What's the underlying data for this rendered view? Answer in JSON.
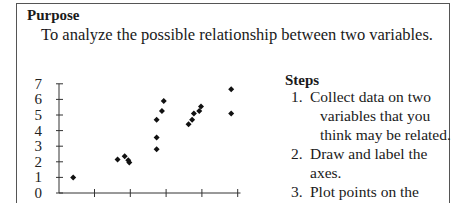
{
  "purpose": {
    "title": "Purpose",
    "text": "To analyze the possible relationship between two variables."
  },
  "steps": {
    "title": "Steps",
    "items": [
      {
        "number": "1.",
        "lines": [
          "Collect data on two",
          "variables that you",
          "think may be related."
        ]
      },
      {
        "number": "2.",
        "lines": [
          "Draw and label the",
          "axes."
        ]
      },
      {
        "number": "3.",
        "lines": [
          "Plot points on the",
          "graph."
        ]
      }
    ]
  },
  "chart_data": {
    "type": "scatter",
    "title": "",
    "xlabel": "",
    "ylabel": "",
    "y_ticks": [
      "0",
      "1",
      "2",
      "3",
      "4",
      "5",
      "6",
      "7"
    ],
    "x_ticks": [
      "",
      "",
      "",
      "",
      ""
    ],
    "ylim": [
      0,
      7
    ],
    "xlim": [
      0,
      5
    ],
    "grid": false,
    "marker": "diamond",
    "points": [
      {
        "x": 0.4,
        "y": 1.0
      },
      {
        "x": 1.65,
        "y": 2.15
      },
      {
        "x": 1.85,
        "y": 2.35
      },
      {
        "x": 1.95,
        "y": 2.1
      },
      {
        "x": 1.98,
        "y": 1.95
      },
      {
        "x": 2.75,
        "y": 2.8
      },
      {
        "x": 2.75,
        "y": 3.55
      },
      {
        "x": 2.75,
        "y": 4.7
      },
      {
        "x": 2.9,
        "y": 5.25
      },
      {
        "x": 2.95,
        "y": 5.9
      },
      {
        "x": 3.65,
        "y": 4.4
      },
      {
        "x": 3.75,
        "y": 4.7
      },
      {
        "x": 3.8,
        "y": 5.1
      },
      {
        "x": 3.95,
        "y": 5.25
      },
      {
        "x": 4.0,
        "y": 5.55
      },
      {
        "x": 4.85,
        "y": 6.65
      },
      {
        "x": 4.85,
        "y": 5.1
      }
    ]
  }
}
